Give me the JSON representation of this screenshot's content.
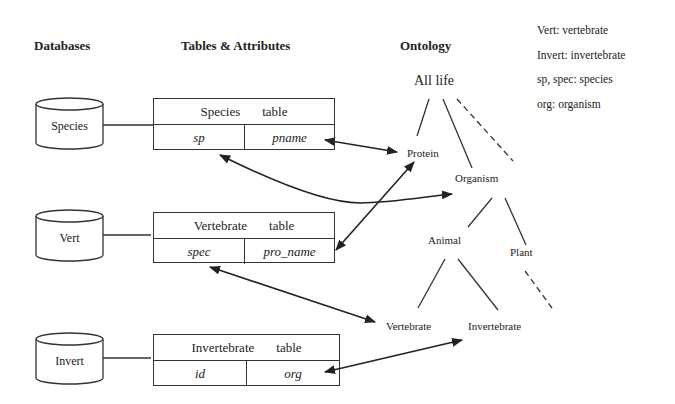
{
  "headers": {
    "databases": "Databases",
    "tables": "Tables & Attributes",
    "ontology": "Ontology"
  },
  "legend": [
    "Vert: vertebrate",
    "Invert: invertebrate",
    "sp, spec: species",
    "org: organism"
  ],
  "databases": [
    {
      "label": "Species"
    },
    {
      "label": "Vert"
    },
    {
      "label": "Invert"
    }
  ],
  "tables": [
    {
      "name": "Species",
      "suffix": "table",
      "attrs": [
        "sp",
        "pname"
      ]
    },
    {
      "name": "Vertebrate",
      "suffix": "table",
      "attrs": [
        "spec",
        "pro_name"
      ]
    },
    {
      "name": "Invertebrate",
      "suffix": "table",
      "attrs": [
        "id",
        "org"
      ]
    }
  ],
  "ontology": {
    "root": "All life",
    "protein": "Protein",
    "organism": "Organism",
    "animal": "Animal",
    "plant": "Plant",
    "vertebrate": "Vertebrate",
    "invertebrate": "Invertebrate"
  }
}
